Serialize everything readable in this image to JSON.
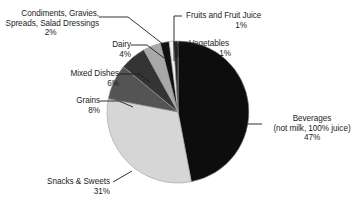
{
  "chart_data": {
    "type": "pie",
    "title": "",
    "subtitle": "",
    "xlabel": "",
    "ylabel": "",
    "legend_position": "callout-labels",
    "grid": false,
    "units": "percent",
    "total": 100,
    "categories": [
      "Beverages (not milk, 100% juice)",
      "Snacks & Sweets",
      "Grains",
      "Mixed Dishes",
      "Dairy",
      "Condiments, Gravies, Spreads, Salad Dressings",
      "Fruits and Fruit Juice",
      "Vegetables"
    ],
    "values": [
      47,
      31,
      8,
      6,
      4,
      2,
      1,
      1
    ],
    "colors": [
      "#0d0d0d",
      "#d6d6d6",
      "#545454",
      "#343434",
      "#a8a8a8",
      "#101010",
      "#f2f2f2",
      "#242424"
    ],
    "slices": [
      {
        "name": "beverages",
        "label_line1": "Beverages",
        "label_line2": "(not milk, 100% juice)",
        "percent": "47%",
        "value": 47,
        "color": "#0d0d0d"
      },
      {
        "name": "snacks-sweets",
        "label_line1": "Snacks & Sweets",
        "label_line2": "",
        "percent": "31%",
        "value": 31,
        "color": "#d6d6d6"
      },
      {
        "name": "grains",
        "label_line1": "Grains",
        "label_line2": "",
        "percent": "8%",
        "value": 8,
        "color": "#545454"
      },
      {
        "name": "mixed-dishes",
        "label_line1": "Mixed Dishes",
        "label_line2": "",
        "percent": "6%",
        "value": 6,
        "color": "#343434"
      },
      {
        "name": "dairy",
        "label_line1": "Dairy",
        "label_line2": "",
        "percent": "4%",
        "value": 4,
        "color": "#a8a8a8"
      },
      {
        "name": "condiments",
        "label_line1": "Condiments, Gravies,",
        "label_line2": "Spreads, Salad Dressings",
        "percent": "2%",
        "value": 2,
        "color": "#101010"
      },
      {
        "name": "fruits",
        "label_line1": "Fruits and Fruit Juice",
        "label_line2": "",
        "percent": "1%",
        "value": 1,
        "color": "#f2f2f2"
      },
      {
        "name": "vegetables",
        "label_line1": "Vegetables",
        "label_line2": "",
        "percent": "1%",
        "value": 1,
        "color": "#242424"
      }
    ]
  },
  "labels": {
    "condiments": {
      "line1": "Condiments, Gravies,",
      "line2": "Spreads, Salad Dressings",
      "pct": "2%"
    },
    "dairy": {
      "line1": "Dairy",
      "pct": "4%"
    },
    "mixed_dishes": {
      "line1": "Mixed Dishes",
      "pct": "6%"
    },
    "grains": {
      "line1": "Grains",
      "pct": "8%"
    },
    "snacks": {
      "line1": "Snacks & Sweets",
      "pct": "31%"
    },
    "fruits": {
      "line1": "Fruits and Fruit Juice",
      "pct": "1%"
    },
    "vegetables": {
      "line1": "Vegetables",
      "pct": "1%"
    },
    "beverages": {
      "line1": "Beverages",
      "line2": "(not milk, 100% juice)",
      "pct": "47%"
    }
  }
}
